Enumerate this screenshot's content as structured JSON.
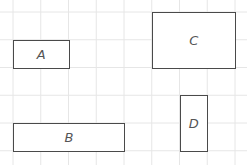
{
  "grid": {
    "x0": 13,
    "y0": 12,
    "cell": 27.75,
    "cols": 8,
    "rows": 5,
    "color": "#e6e6e6"
  },
  "shapes": [
    {
      "label": "A",
      "col": 0,
      "row": 1,
      "w": 2,
      "h": 1
    },
    {
      "label": "C",
      "col": 5,
      "row": 0,
      "w": 3,
      "h": 2
    },
    {
      "label": "B",
      "col": 0,
      "row": 4,
      "w": 4,
      "h": 1
    },
    {
      "label": "D",
      "col": 6,
      "row": 3,
      "w": 1,
      "h": 2
    }
  ],
  "colors": {
    "border": "#4a4a4a",
    "label": "#555555"
  }
}
